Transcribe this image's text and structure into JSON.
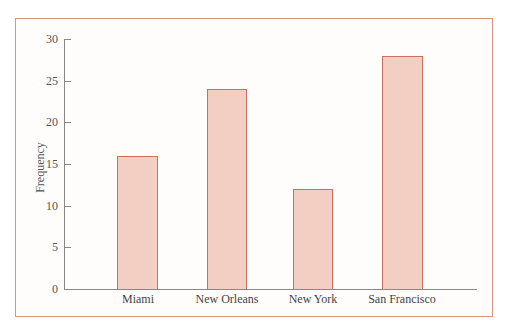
{
  "chart_data": {
    "type": "bar",
    "title": "",
    "xlabel": "",
    "ylabel": "Frequency",
    "categories": [
      "Miami",
      "New Orleans",
      "New York",
      "San Francisco"
    ],
    "values": [
      16,
      24,
      12,
      28
    ],
    "ylim": [
      0,
      30
    ],
    "yticks": [
      0,
      5,
      10,
      15,
      20,
      25,
      30
    ],
    "grid": false,
    "legend": null,
    "colors": {
      "bar_fill": "#f2cfc2",
      "bar_edge": "#cd6f5e",
      "frame": "#d3957f",
      "axis": "#888888"
    }
  },
  "axis": {
    "ylabel": "Frequency",
    "yticks": [
      "0",
      "5",
      "10",
      "15",
      "20",
      "25",
      "30"
    ]
  },
  "bars": [
    {
      "label": "Miami",
      "value": 16
    },
    {
      "label": "New Orleans",
      "value": 24
    },
    {
      "label": "New York",
      "value": 12
    },
    {
      "label": "San Francisco",
      "value": 28
    }
  ]
}
